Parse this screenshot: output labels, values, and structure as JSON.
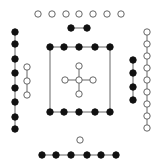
{
  "diagram": {
    "title": "He Tu (River Chart)",
    "colors": {
      "yin": "#111111",
      "yang": "#ffffff",
      "stroke": "#555555",
      "line": "#666666"
    },
    "radius": 3.2,
    "groups": [
      {
        "name": "north-outer-yang-7",
        "type": "white",
        "count": 7,
        "connected": false,
        "points": [
          [
            38,
            14
          ],
          [
            52,
            14
          ],
          [
            66,
            14
          ],
          [
            79,
            14
          ],
          [
            93,
            14
          ],
          [
            107,
            14
          ],
          [
            121,
            14
          ]
        ]
      },
      {
        "name": "north-inner-yin-2",
        "type": "black",
        "count": 2,
        "connected": true,
        "points": [
          [
            71,
            28
          ],
          [
            87,
            28
          ]
        ]
      },
      {
        "name": "west-outer-yin-8",
        "type": "black",
        "count": 8,
        "connected": true,
        "points": [
          [
            15,
            32
          ],
          [
            15,
            44
          ],
          [
            15,
            59
          ],
          [
            15,
            73
          ],
          [
            15,
            88
          ],
          [
            15,
            102
          ],
          [
            15,
            117
          ],
          [
            15,
            129
          ]
        ]
      },
      {
        "name": "west-inner-yang-3",
        "type": "white",
        "count": 3,
        "connected": true,
        "points": [
          [
            27,
            67
          ],
          [
            27,
            81
          ],
          [
            27,
            95
          ]
        ]
      },
      {
        "name": "east-inner-yin-4",
        "type": "black",
        "count": 4,
        "connected": true,
        "points": [
          [
            133,
            60
          ],
          [
            133,
            73
          ],
          [
            133,
            87
          ],
          [
            133,
            100
          ]
        ]
      },
      {
        "name": "east-outer-yang-9",
        "type": "white",
        "count": 9,
        "connected": true,
        "points": [
          [
            147,
            32
          ],
          [
            147,
            44
          ],
          [
            147,
            56
          ],
          [
            147,
            68
          ],
          [
            147,
            80
          ],
          [
            147,
            92
          ],
          [
            147,
            104
          ],
          [
            147,
            116
          ],
          [
            147,
            128
          ]
        ]
      },
      {
        "name": "center-top-yin-5",
        "type": "black",
        "count": 5,
        "connected": true,
        "points": [
          [
            50,
            47
          ],
          [
            64,
            47
          ],
          [
            79,
            47
          ],
          [
            95,
            47
          ],
          [
            110,
            47
          ]
        ]
      },
      {
        "name": "center-bottom-yin-5",
        "type": "black",
        "count": 5,
        "connected": true,
        "points": [
          [
            50,
            112
          ],
          [
            64,
            112
          ],
          [
            79,
            112
          ],
          [
            95,
            112
          ],
          [
            110,
            112
          ]
        ]
      },
      {
        "name": "south-inner-yang-1",
        "type": "white",
        "count": 1,
        "connected": false,
        "points": [
          [
            80,
            140
          ]
        ]
      },
      {
        "name": "south-outer-yin-6",
        "type": "black",
        "count": 6,
        "connected": true,
        "points": [
          [
            42,
            155
          ],
          [
            56,
            155
          ],
          [
            71,
            155
          ],
          [
            87,
            155
          ],
          [
            101,
            155
          ],
          [
            116,
            155
          ]
        ]
      }
    ],
    "center_cross": {
      "name": "center-yang-5",
      "type": "white",
      "count": 5,
      "center": [
        79,
        80
      ],
      "arm": 14
    },
    "square_sides": [
      [
        [
          50,
          47
        ],
        [
          50,
          112
        ]
      ],
      [
        [
          110,
          47
        ],
        [
          110,
          112
        ]
      ]
    ]
  }
}
